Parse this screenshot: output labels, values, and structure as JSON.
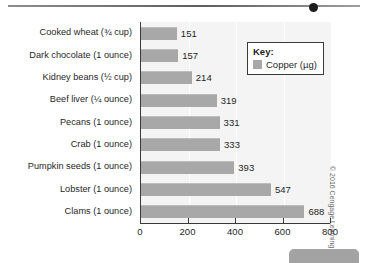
{
  "decorations": {
    "top_rule_name": "top-divider-rule",
    "top_dot_name": "divider-marker-dot",
    "corner_tab_name": "corner-tab"
  },
  "credit": {
    "text": "© 2016 Cengage Learning"
  },
  "legend": {
    "title": "Key:",
    "entry_label": "Copper (µg)",
    "swatch_color": "#a8a8a8"
  },
  "chart_data": {
    "type": "bar",
    "orientation": "horizontal",
    "title": "",
    "xlabel": "",
    "ylabel": "",
    "xlim": [
      0,
      800
    ],
    "xticks": [
      0,
      200,
      400,
      600,
      800
    ],
    "xtick_labels": [
      "0",
      "200",
      "400",
      "600",
      "800"
    ],
    "grid": true,
    "legend_position": "top-right",
    "series": [
      {
        "name": "Copper (µg)",
        "color": "#a8a8a8",
        "values": [
          151,
          157,
          214,
          319,
          331,
          333,
          393,
          547,
          688
        ]
      }
    ],
    "categories": [
      "Cooked wheat (¾ cup)",
      "Dark chocolate (1 ounce)",
      "Kidney beans (½ cup)",
      "Beef liver (¼ ounce)",
      "Pecans (1 ounce)",
      "Crab (1 ounce)",
      "Pumpkin seeds (1 ounce)",
      "Lobster (1 ounce)",
      "Clams (1 ounce)"
    ],
    "value_labels": [
      "151",
      "157",
      "214",
      "319",
      "331",
      "333",
      "393",
      "547",
      "688"
    ]
  }
}
